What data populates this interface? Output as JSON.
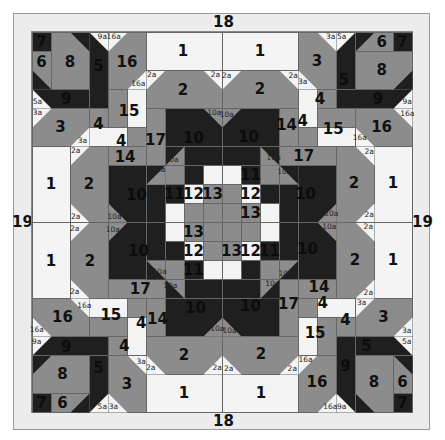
{
  "colors": {
    "D": "#1f1f1f",
    "G": "#8c8c8c",
    "W": "#f4f4f4",
    "frame": "#ececec",
    "line": "#666666"
  },
  "grid": {
    "origin_x": 32,
    "origin_y": 32,
    "cell": 19,
    "cells": 20
  },
  "border_labels": {
    "top": "18",
    "bottom": "18",
    "left": "19",
    "right": "19"
  },
  "quadrant_rotations": [
    0,
    1,
    2,
    3
  ],
  "blocks": [
    {
      "r": 0,
      "c": 0,
      "h": 1,
      "w": 1,
      "col": "D"
    },
    {
      "r": 1,
      "c": 0,
      "h": 2,
      "w": 1,
      "col": "G"
    },
    {
      "r": 0,
      "c": 1,
      "h": 3,
      "w": 2,
      "col": "G"
    },
    {
      "r": 0,
      "c": 3,
      "h": 4,
      "w": 1,
      "col": "D"
    },
    {
      "r": 3,
      "c": 0,
      "h": 1,
      "w": 3,
      "col": "D"
    },
    {
      "r": 0,
      "c": 4,
      "h": 3,
      "w": 2,
      "col": "G"
    },
    {
      "r": 0,
      "c": 6,
      "h": 2,
      "w": 4,
      "col": "W"
    },
    {
      "r": 2,
      "c": 6,
      "h": 2,
      "w": 4,
      "col": "G"
    },
    {
      "r": 3,
      "c": 4,
      "h": 2,
      "w": 1,
      "col": "G"
    },
    {
      "r": 3,
      "c": 5,
      "h": 2,
      "w": 1,
      "col": "W"
    },
    {
      "r": 4,
      "c": 0,
      "h": 2,
      "w": 3,
      "col": "G"
    },
    {
      "r": 4,
      "c": 3,
      "h": 1,
      "w": 1,
      "col": "G"
    },
    {
      "r": 5,
      "c": 3,
      "h": 1,
      "w": 2,
      "col": "W"
    },
    {
      "r": 5,
      "c": 5,
      "h": 1,
      "w": 1,
      "col": "G"
    },
    {
      "r": 4,
      "c": 6,
      "h": 3,
      "w": 1,
      "col": "G"
    },
    {
      "r": 6,
      "c": 4,
      "h": 1,
      "w": 2,
      "col": "G"
    },
    {
      "r": 6,
      "c": 0,
      "h": 4,
      "w": 2,
      "col": "W"
    },
    {
      "r": 6,
      "c": 2,
      "h": 4,
      "w": 2,
      "col": "G"
    },
    {
      "r": 4,
      "c": 7,
      "h": 2,
      "w": 3,
      "col": "D"
    },
    {
      "r": 6,
      "c": 7,
      "h": 1,
      "w": 1,
      "col": "G"
    },
    {
      "r": 6,
      "c": 8,
      "h": 1,
      "w": 2,
      "col": "D"
    },
    {
      "r": 7,
      "c": 4,
      "h": 3,
      "w": 2,
      "col": "D"
    },
    {
      "r": 7,
      "c": 6,
      "h": 1,
      "w": 1,
      "col": "D"
    },
    {
      "r": 8,
      "c": 6,
      "h": 2,
      "w": 1,
      "col": "D"
    },
    {
      "r": 7,
      "c": 7,
      "h": 1,
      "w": 1,
      "col": "G"
    },
    {
      "r": 7,
      "c": 8,
      "h": 1,
      "w": 1,
      "col": "D"
    },
    {
      "r": 7,
      "c": 9,
      "h": 1,
      "w": 1,
      "col": "W"
    },
    {
      "r": 8,
      "c": 7,
      "h": 1,
      "w": 1,
      "col": "D"
    },
    {
      "r": 8,
      "c": 8,
      "h": 1,
      "w": 1,
      "col": "W"
    },
    {
      "r": 8,
      "c": 9,
      "h": 1,
      "w": 1,
      "col": "G"
    },
    {
      "r": 9,
      "c": 7,
      "h": 1,
      "w": 1,
      "col": "W"
    },
    {
      "r": 9,
      "c": 8,
      "h": 1,
      "w": 1,
      "col": "G"
    },
    {
      "r": 9,
      "c": 9,
      "h": 1,
      "w": 1,
      "col": "G"
    }
  ],
  "triangles": [
    {
      "r": 2,
      "c": 0,
      "corner": "bl",
      "col": "D"
    },
    {
      "r": 0,
      "c": 2,
      "corner": "tr",
      "col": "D"
    },
    {
      "r": 0,
      "c": 3,
      "corner": "tr",
      "col": "W"
    },
    {
      "r": 0,
      "c": 4,
      "corner": "tl",
      "col": "W"
    },
    {
      "r": 2,
      "c": 5,
      "corner": "br",
      "col": "W"
    },
    {
      "r": 2,
      "c": 6,
      "corner": "tl",
      "col": "W"
    },
    {
      "r": 2,
      "c": 9,
      "corner": "tr",
      "col": "W"
    },
    {
      "r": 3,
      "c": 0,
      "corner": "bl",
      "col": "W"
    },
    {
      "r": 4,
      "c": 0,
      "corner": "tl",
      "col": "W"
    },
    {
      "r": 5,
      "c": 2,
      "corner": "br",
      "col": "W"
    },
    {
      "r": 6,
      "c": 2,
      "corner": "tl",
      "col": "W"
    },
    {
      "r": 9,
      "c": 2,
      "corner": "bl",
      "col": "W"
    },
    {
      "r": 4,
      "c": 9,
      "corner": "tr",
      "col": "G"
    },
    {
      "r": 6,
      "c": 7,
      "corner": "tl",
      "col": "D"
    },
    {
      "r": 7,
      "c": 6,
      "corner": "br",
      "col": "G"
    },
    {
      "r": 9,
      "c": 4,
      "corner": "bl",
      "col": "G"
    }
  ],
  "labels": [
    {
      "t": "7",
      "r": 0.5,
      "c": 0.5,
      "size": "big",
      "dark": true
    },
    {
      "t": "6",
      "r": 1.6,
      "c": 0.5,
      "size": "big"
    },
    {
      "t": "8",
      "r": 1.6,
      "c": 2.0,
      "size": "big"
    },
    {
      "t": "16",
      "r": 1.6,
      "c": 5.0,
      "size": "big"
    },
    {
      "t": "9a",
      "r": 0.25,
      "c": 3.7,
      "size": "small"
    },
    {
      "t": "16a",
      "r": 0.25,
      "c": 4.3,
      "size": "small"
    },
    {
      "t": "16a",
      "r": 2.75,
      "c": 5.6,
      "size": "small"
    },
    {
      "t": "5a",
      "r": 3.7,
      "c": 0.28,
      "size": "small"
    },
    {
      "t": "3a",
      "r": 4.28,
      "c": 0.28,
      "size": "small"
    },
    {
      "t": "3",
      "r": 5.0,
      "c": 1.5,
      "size": "big"
    },
    {
      "t": "4",
      "r": 4.85,
      "c": 3.5,
      "size": "big"
    },
    {
      "t": "4",
      "r": 5.75,
      "c": 4.7,
      "size": "big"
    },
    {
      "t": "15",
      "r": 4.15,
      "c": 5.1,
      "size": "big"
    },
    {
      "t": "3a",
      "r": 5.75,
      "c": 2.65,
      "size": "small"
    },
    {
      "t": "1",
      "r": 1.0,
      "c": 7.95,
      "size": "big"
    },
    {
      "t": "2",
      "r": 3.05,
      "c": 7.95,
      "size": "big"
    },
    {
      "t": "2a",
      "r": 2.25,
      "c": 6.3,
      "size": "small"
    },
    {
      "t": "2a",
      "r": 2.25,
      "c": 9.65,
      "size": "small"
    },
    {
      "t": "1",
      "r": 8.0,
      "c": 1.0,
      "size": "big"
    },
    {
      "t": "2",
      "r": 8.0,
      "c": 3.0,
      "size": "big"
    },
    {
      "t": "2a",
      "r": 6.25,
      "c": 2.3,
      "size": "small"
    },
    {
      "t": "2a",
      "r": 9.75,
      "c": 2.3,
      "size": "small"
    },
    {
      "t": "17",
      "r": 5.7,
      "c": 6.5,
      "size": "big"
    },
    {
      "t": "14",
      "r": 6.6,
      "c": 4.9,
      "size": "big"
    },
    {
      "t": "10",
      "r": 5.6,
      "c": 8.5,
      "size": "big",
      "dark": true
    },
    {
      "t": "10",
      "r": 8.6,
      "c": 5.5,
      "size": "big",
      "dark": true
    },
    {
      "t": "10a",
      "r": 4.25,
      "c": 9.6,
      "size": "small"
    },
    {
      "t": "10a",
      "r": 6.72,
      "c": 7.35,
      "size": "small"
    },
    {
      "t": "10a",
      "r": 7.28,
      "c": 6.65,
      "size": "small"
    },
    {
      "t": "10a",
      "r": 9.75,
      "c": 4.35,
      "size": "small"
    },
    {
      "t": "11",
      "r": 8.5,
      "c": 7.5,
      "size": "big",
      "dark": true
    },
    {
      "t": "12",
      "r": 8.5,
      "c": 8.5,
      "size": "big"
    },
    {
      "t": "13",
      "r": 8.5,
      "c": 9.5,
      "size": "big"
    }
  ],
  "fixed_labels": [
    {
      "t": "9",
      "r": 3.5,
      "c": 1.8,
      "dark": true
    },
    {
      "t": "5",
      "r": 1.8,
      "c": 3.5,
      "dark": true
    },
    {
      "t": "5",
      "r": 2.5,
      "c": 16.4,
      "dark": true
    },
    {
      "t": "9",
      "r": 3.5,
      "c": 18.2,
      "dark": true
    },
    {
      "t": "5",
      "r": 16.5,
      "c": 17.6,
      "dark": true
    },
    {
      "t": "9",
      "r": 17.6,
      "c": 16.5,
      "dark": true
    },
    {
      "t": "9",
      "r": 16.6,
      "c": 1.8,
      "dark": true
    },
    {
      "t": "5",
      "r": 17.7,
      "c": 3.5,
      "dark": true
    }
  ]
}
